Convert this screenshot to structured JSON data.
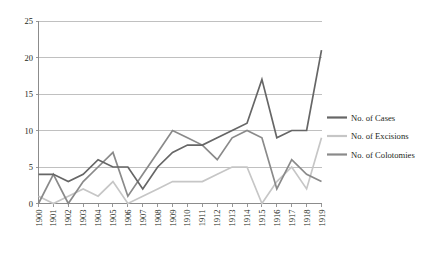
{
  "chart_data": {
    "type": "line",
    "title": "",
    "xlabel": "",
    "ylabel": "",
    "ylim": [
      0,
      25
    ],
    "ytick_values": [
      0,
      5,
      10,
      15,
      20,
      25
    ],
    "ytick_labels": [
      "0",
      "5",
      "10",
      "15",
      "20",
      "25"
    ],
    "grid": true,
    "legend_position": "right",
    "categories": [
      "1900",
      "1901",
      "1902",
      "1903",
      "1904",
      "1905",
      "1906",
      "1907",
      "1908",
      "1909",
      "1910",
      "1911",
      "1912",
      "1913",
      "1914",
      "1915",
      "1916",
      "1917",
      "1918",
      "1919"
    ],
    "series": [
      {
        "name": "No. of Cases",
        "color": "#666666",
        "values": [
          4,
          4,
          3,
          4,
          6,
          5,
          5,
          2,
          5,
          7,
          8,
          8,
          9,
          10,
          11,
          17,
          9,
          10,
          10,
          21
        ]
      },
      {
        "name": "No. of Excisions",
        "color": "#c6c6c6",
        "values": [
          1,
          0,
          1,
          2,
          1,
          3,
          0,
          1,
          2,
          3,
          3,
          3,
          4,
          5,
          5,
          0,
          3,
          5,
          2,
          9
        ]
      },
      {
        "name": "No. of Colotomies",
        "color": "#8a8a8a",
        "values": [
          0,
          4,
          0,
          3,
          5,
          7,
          1,
          4,
          7,
          10,
          9,
          8,
          6,
          9,
          10,
          9,
          2,
          6,
          4,
          3
        ]
      }
    ]
  },
  "legend": {
    "items": [
      {
        "label": "No. of Cases"
      },
      {
        "label": "No. of Excisions"
      },
      {
        "label": "No. of Colotomies"
      }
    ]
  },
  "colors": {
    "cases": "#666666",
    "excisions": "#c6c6c6",
    "colotomies": "#8a8a8a",
    "axis": "#8c8c8c",
    "grid": "#b9b9b9",
    "text": "#231f20",
    "background": "#ffffff"
  }
}
